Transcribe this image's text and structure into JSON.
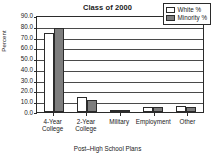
{
  "chart_data": {
    "type": "bar",
    "title": "Class of 2000",
    "xlabel": "Post–High School Plans",
    "ylabel": "Percent",
    "categories": [
      "4-Year College",
      "2-Year College",
      "Military",
      "Employment",
      "Other"
    ],
    "category_lines": [
      [
        "4-Year",
        "College"
      ],
      [
        "2-Year",
        "College"
      ],
      [
        "Military",
        ""
      ],
      [
        "Employment",
        ""
      ],
      [
        "Other",
        ""
      ]
    ],
    "series": [
      {
        "name": "White %",
        "color": "#ffffff",
        "values": [
          73.0,
          13.5,
          1.0,
          4.5,
          5.5
        ]
      },
      {
        "name": "Minority %",
        "color": "#7d7d7d",
        "values": [
          77.5,
          11.0,
          2.0,
          5.0,
          5.0
        ]
      }
    ],
    "ylim": [
      0.0,
      90.0
    ],
    "ytick_step": 10.0,
    "ytick_labels": [
      "90.0",
      "80.0",
      "70.0",
      "60.0",
      "50.0",
      "40.0",
      "30.0",
      "20.0",
      "10.0",
      "0.0"
    ],
    "grid": true,
    "grid_axis": "y",
    "legend_position": "top-right-inside"
  }
}
